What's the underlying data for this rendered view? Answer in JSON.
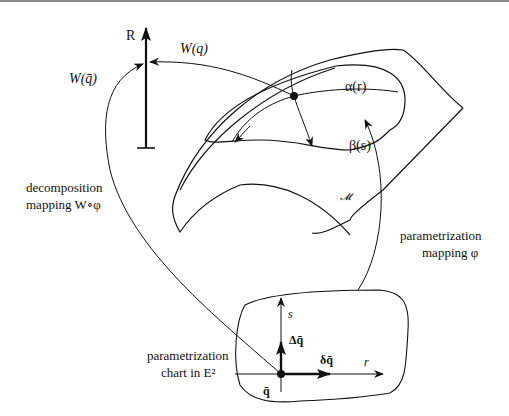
{
  "diagram": {
    "axis_R_label": "R",
    "W_q_label": "W(q)",
    "W_qbar_label": "W(q̄)",
    "alpha_label": "α(r)",
    "beta_label": "β(s)",
    "manifold_label": "𝓜",
    "decomposition_line1": "decomposition",
    "decomposition_line2": "mapping W∘φ",
    "parametrization_line1": "parametrization",
    "parametrization_line2": "mapping φ",
    "chart_line1": "parametrization",
    "chart_line2": "chart in E²",
    "s_axis_label": "s",
    "r_axis_label": "r",
    "delta_cap_label": "Δq̄",
    "delta_small_label": "δq̄",
    "qbar_label": "q̄"
  },
  "colors": {
    "stroke": "#111111",
    "background": "#ffffff",
    "top_rule": "#8a8a8a"
  }
}
